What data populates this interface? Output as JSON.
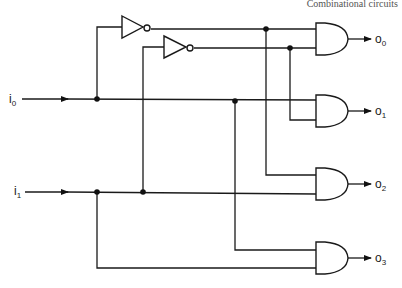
{
  "header": {
    "text": "Combinational circuits"
  },
  "diagram": {
    "inputs": [
      {
        "name": "i0",
        "base": "i",
        "sub": "0"
      },
      {
        "name": "i1",
        "base": "i",
        "sub": "1"
      }
    ],
    "outputs": [
      {
        "name": "o0",
        "base": "o",
        "sub": "0"
      },
      {
        "name": "o1",
        "base": "o",
        "sub": "1"
      },
      {
        "name": "o2",
        "base": "o",
        "sub": "2"
      },
      {
        "name": "o3",
        "base": "o",
        "sub": "3"
      }
    ],
    "gates": [
      {
        "id": "not0",
        "type": "NOT",
        "input": "i0"
      },
      {
        "id": "not1",
        "type": "NOT",
        "input": "i1"
      },
      {
        "id": "and0",
        "type": "AND",
        "inputs": [
          "not i0",
          "not i1"
        ],
        "output": "o0"
      },
      {
        "id": "and1",
        "type": "AND",
        "inputs": [
          "i0",
          "not i1"
        ],
        "output": "o1"
      },
      {
        "id": "and2",
        "type": "AND",
        "inputs": [
          "not i0",
          "i1"
        ],
        "output": "o2"
      },
      {
        "id": "and3",
        "type": "AND",
        "inputs": [
          "i0",
          "i1"
        ],
        "output": "o3"
      }
    ]
  }
}
